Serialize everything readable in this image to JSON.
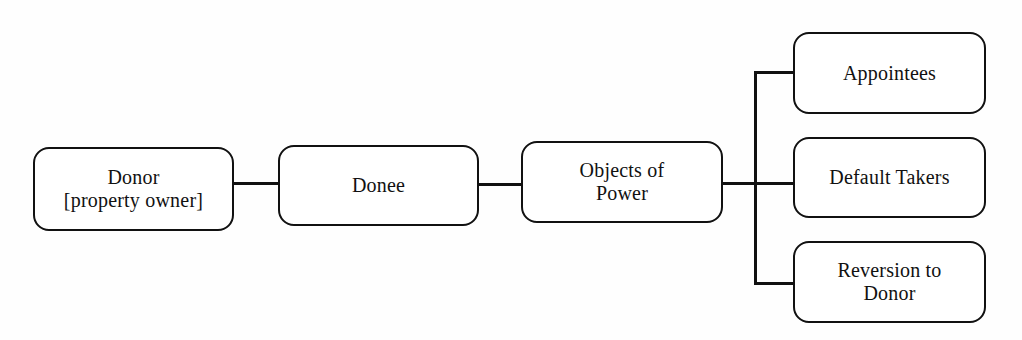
{
  "diagram": {
    "type": "flow-chart",
    "background_color": "#fefefe",
    "line_color": "#111111",
    "box_fill_color": "#ffffff",
    "nodes": [
      {
        "id": "donor",
        "label": "Donor\n[property owner]"
      },
      {
        "id": "donee",
        "label": "Donee"
      },
      {
        "id": "objects",
        "label": "Objects of\nPower"
      },
      {
        "id": "appointees",
        "label": "Appointees"
      },
      {
        "id": "default",
        "label": "Default Takers"
      },
      {
        "id": "reversion",
        "label": "Reversion to\nDonor"
      }
    ],
    "connectors": [
      {
        "id": "donor-donee",
        "from": "donor",
        "to": "donee",
        "style": "straight"
      },
      {
        "id": "donee-objects",
        "from": "donee",
        "to": "objects",
        "style": "straight"
      },
      {
        "id": "objects-trunk",
        "from": "objects",
        "to": "branch-bus",
        "style": "straight"
      },
      {
        "id": "branch-top",
        "from": "branch-bus",
        "to": "appointees",
        "style": "elbow"
      },
      {
        "id": "branch-mid",
        "from": "branch-bus",
        "to": "default",
        "style": "straight"
      },
      {
        "id": "branch-bottom",
        "from": "branch-bus",
        "to": "reversion",
        "style": "elbow"
      }
    ]
  }
}
